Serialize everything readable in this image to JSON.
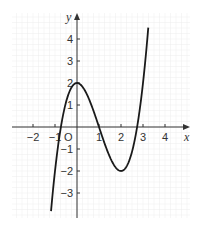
{
  "chart_data": {
    "type": "line",
    "title": "",
    "xlabel": "x",
    "ylabel": "y",
    "origin_label": "O",
    "xlim": [
      -3,
      5
    ],
    "ylim": [
      -4,
      5
    ],
    "grid": true,
    "x_ticks": [
      -2,
      -1,
      1,
      2,
      3,
      4
    ],
    "y_ticks": [
      -3,
      -2,
      -1,
      1,
      2,
      3,
      4
    ],
    "x_tick_labels": [
      "−2",
      "−1",
      "1",
      "2",
      "3",
      "4"
    ],
    "y_tick_labels": [
      "−3",
      "−2",
      "−1",
      "1",
      "2",
      "3",
      "4"
    ],
    "series": [
      {
        "name": "y = x^3 - 3x^2 + 2",
        "color": "#1a1a1a",
        "x": [
          -1.18,
          -1.0,
          -0.732,
          -0.5,
          0,
          0.5,
          1,
          1.5,
          2,
          2.5,
          2.732,
          3,
          3.24
        ],
        "y": [
          -3.82,
          -2.0,
          0,
          1.125,
          2,
          1.375,
          0,
          -1.375,
          -2,
          -1.125,
          0,
          2,
          4.3
        ]
      }
    ],
    "key_points": {
      "local_max": [
        0,
        2
      ],
      "local_min": [
        2,
        -2
      ],
      "roots": [
        -0.732,
        1,
        2.732
      ]
    }
  },
  "colors": {
    "grid": "#ececec",
    "axis": "#333333",
    "curve": "#1a1a1a"
  }
}
